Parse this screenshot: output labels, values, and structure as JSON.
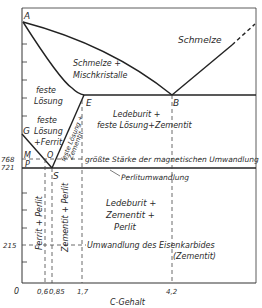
{
  "diagram": {
    "xlabel": "C-Gehalt",
    "x_ticks": [
      {
        "label": "0",
        "x": 22
      },
      {
        "label": "0,6",
        "x": 45
      },
      {
        "label": "0,85",
        "x": 52
      },
      {
        "label": "1,7",
        "x": 82
      },
      {
        "label": "4,2",
        "x": 172
      }
    ],
    "y_ticks": [
      {
        "label": "768",
        "y": 159
      },
      {
        "label": "721",
        "y": 168
      },
      {
        "label": "215",
        "y": 245
      }
    ],
    "points": {
      "A": "A",
      "B": "B",
      "E": "E",
      "G": "G",
      "M": "M",
      "O": "O",
      "P": "P",
      "S": "S"
    },
    "regions": {
      "schmelze": "Schmelze",
      "schmelze_misch_1": "Schmelze +",
      "schmelze_misch_2": "Mischkristalle",
      "feste_loesung_1": "feste",
      "feste_loesung_2": "Lösung",
      "feste_ferrit_1": "feste",
      "feste_ferrit_2": "Lösung",
      "feste_ferrit_3": "+Ferrit",
      "feste_zementit_1": "feste Lösung +",
      "feste_zementit_2": "Zementit",
      "ledeburit_upper_1": "Ledeburit +",
      "ledeburit_upper_2": "feste Lösung+Zementit",
      "magnetic": "größte Stärke der magnetischen Umwandlung",
      "perlit_umw": "Perlitumwandlung",
      "ferrit_perlit": "Ferrit + Perlit",
      "zementit_perlit": "Zementit + Perlit",
      "ledeburit_lower_1": "Ledeburit +",
      "ledeburit_lower_2": "Zementit +",
      "ledeburit_lower_3": "Perlit",
      "eisenkarbide_1": "Umwandlung des Eisenkarbides",
      "eisenkarbide_2": "(Zementit)"
    }
  }
}
